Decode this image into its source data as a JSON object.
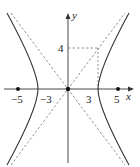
{
  "diagram": {
    "type": "hyperbola",
    "equation_params": {
      "a": 3,
      "b": 4,
      "c": 5
    },
    "axes": {
      "x_label": "x",
      "y_label": "y"
    },
    "x_ticks": [
      {
        "value": -5,
        "label": "−5"
      },
      {
        "value": -3,
        "label": "−3"
      },
      {
        "value": 3,
        "label": "3"
      },
      {
        "value": 5,
        "label": "5"
      }
    ],
    "y_ticks": [
      {
        "value": 4,
        "label": "4"
      }
    ],
    "foci": [
      -5,
      5
    ],
    "vertices": [
      -3,
      3
    ],
    "asymptotes": [
      "y = 4x/3",
      "y = -4x/3"
    ],
    "colors": {
      "curve": "#333333",
      "dashed": "#777777",
      "axis": "#333333"
    }
  }
}
